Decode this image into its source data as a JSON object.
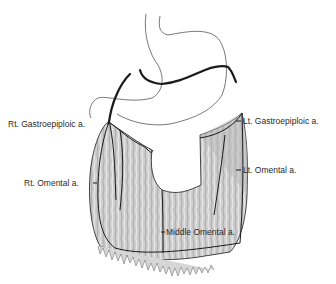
{
  "diagram": {
    "type": "anatomical illustration",
    "colors": {
      "background": "#ffffff",
      "outline": "#1a1a1a",
      "tissue_fill": "#c8c8c8",
      "tissue_shade": "#a8a8a8",
      "label_text": "#2a2a2a"
    },
    "labels": {
      "rt_gastroepiploic": "Rt. Gastroepiploic a.",
      "lt_gastroepiploic": "Lt. Gastroepiploic a.",
      "rt_omental": "Rt. Omental a.",
      "lt_omental": "Lt. Omental a.",
      "middle_omental": "Middle Omental a."
    }
  }
}
